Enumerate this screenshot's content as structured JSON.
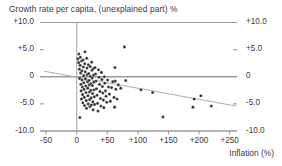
{
  "chart_data": {
    "type": "scatter",
    "title": "Growth rate per capita, (unexplained part) %",
    "xlabel": "Inflation (%)",
    "ylabel": "",
    "xlim": [
      -60,
      262
    ],
    "ylim": [
      -10,
      10
    ],
    "grid": false,
    "legend": null,
    "x_ticks": [
      -50,
      0,
      50,
      100,
      150,
      200,
      250
    ],
    "x_tick_labels": [
      "-50",
      "0",
      "+50",
      "+100",
      "+150",
      "+200",
      "+250"
    ],
    "y_ticks": [
      10,
      5,
      0,
      -5,
      -10
    ],
    "y_tick_labels_left": [
      "+10.0",
      "+5.0",
      "0",
      "-5.0",
      "-10.0"
    ],
    "y_tick_labels_right": [
      "+10.0",
      "+5.0",
      "0",
      "-5.0",
      "-10.0"
    ],
    "reference_lines": {
      "vertical_at_x": 0,
      "horizontal_at_y": 0
    },
    "trend_line": {
      "x_start": -53,
      "y_start": 1.0,
      "x_end": 260,
      "y_end": -5.4
    },
    "series": [
      {
        "name": "countries",
        "marker": "filled-circle",
        "color": "#333333",
        "points": [
          [
            2.0,
            3.3
          ],
          [
            3.1,
            2.6
          ],
          [
            3.6,
            4.2
          ],
          [
            4.4,
            1.4
          ],
          [
            4.8,
            -0.3
          ],
          [
            5.2,
            -7.5
          ],
          [
            5.6,
            2.1
          ],
          [
            6.0,
            3.6
          ],
          [
            6.4,
            0.7
          ],
          [
            6.8,
            -1.4
          ],
          [
            7.2,
            -2.6
          ],
          [
            7.6,
            -4.1
          ],
          [
            8.0,
            2.9
          ],
          [
            8.4,
            1.1
          ],
          [
            8.8,
            -0.6
          ],
          [
            9.2,
            -1.9
          ],
          [
            9.6,
            -3.3
          ],
          [
            10.0,
            -4.8
          ],
          [
            10.4,
            3.1
          ],
          [
            10.8,
            1.8
          ],
          [
            11.2,
            0.2
          ],
          [
            11.6,
            -1.1
          ],
          [
            12.0,
            -2.3
          ],
          [
            12.4,
            -3.8
          ],
          [
            12.8,
            -5.3
          ],
          [
            13.2,
            2.4
          ],
          [
            13.6,
            4.6
          ],
          [
            14.0,
            0.9
          ],
          [
            14.4,
            -0.4
          ],
          [
            14.8,
            -1.7
          ],
          [
            15.2,
            -2.9
          ],
          [
            15.6,
            -4.4
          ],
          [
            16.0,
            -5.8
          ],
          [
            16.4,
            3.4
          ],
          [
            16.8,
            1.6
          ],
          [
            17.2,
            0.4
          ],
          [
            17.6,
            -0.9
          ],
          [
            18.0,
            -2.1
          ],
          [
            18.4,
            -3.5
          ],
          [
            18.8,
            -5.0
          ],
          [
            19.2,
            2.2
          ],
          [
            19.6,
            0.6
          ],
          [
            20.0,
            -0.7
          ],
          [
            20.4,
            -1.5
          ],
          [
            20.8,
            -2.8
          ],
          [
            21.2,
            -4.2
          ],
          [
            21.6,
            -5.5
          ],
          [
            22.0,
            1.9
          ],
          [
            22.4,
            0.1
          ],
          [
            22.8,
            -1.3
          ],
          [
            23.2,
            -2.5
          ],
          [
            23.6,
            -3.9
          ],
          [
            24.0,
            -5.2
          ],
          [
            24.4,
            2.7
          ],
          [
            24.8,
            1.2
          ],
          [
            25.2,
            -0.2
          ],
          [
            25.6,
            -1.6
          ],
          [
            26.0,
            -3.1
          ],
          [
            26.4,
            -4.6
          ],
          [
            26.8,
            -6.1
          ],
          [
            27.2,
            1.5
          ],
          [
            27.6,
            0.3
          ],
          [
            28.0,
            -1.0
          ],
          [
            28.4,
            -2.4
          ],
          [
            28.8,
            -3.7
          ],
          [
            29.2,
            -5.1
          ],
          [
            30.0,
            1.7
          ],
          [
            30.8,
            0.5
          ],
          [
            31.6,
            -0.8
          ],
          [
            32.4,
            -2.2
          ],
          [
            33.2,
            -3.4
          ],
          [
            34.0,
            -4.9
          ],
          [
            34.8,
            -6.3
          ],
          [
            35.6,
            1.3
          ],
          [
            36.4,
            -0.1
          ],
          [
            37.2,
            -1.4
          ],
          [
            38.0,
            -2.7
          ],
          [
            38.8,
            -4.0
          ],
          [
            39.6,
            -5.4
          ],
          [
            40.4,
            0.8
          ],
          [
            41.2,
            -0.5
          ],
          [
            42.0,
            -1.8
          ],
          [
            42.8,
            -3.0
          ],
          [
            43.6,
            -4.3
          ],
          [
            44.4,
            -5.7
          ],
          [
            45.2,
            0.0
          ],
          [
            46.0,
            -1.2
          ],
          [
            47.0,
            -2.6
          ],
          [
            48.0,
            -3.6
          ],
          [
            49.0,
            -4.7
          ],
          [
            50.5,
            -0.6
          ],
          [
            52.0,
            -1.9
          ],
          [
            53.5,
            -3.2
          ],
          [
            55.0,
            -4.5
          ],
          [
            57.0,
            -2.0
          ],
          [
            59.0,
            -0.9
          ],
          [
            61.0,
            -3.8
          ],
          [
            62.0,
            -5.6
          ],
          [
            62.5,
            1.7
          ],
          [
            63.0,
            -0.8
          ],
          [
            64.0,
            -2.3
          ],
          [
            66.0,
            -4.1
          ],
          [
            68.0,
            -1.5
          ],
          [
            72.0,
            -2.1
          ],
          [
            78.0,
            5.5
          ],
          [
            80.0,
            -0.7
          ],
          [
            105.0,
            -2.4
          ],
          [
            124.0,
            -2.9
          ],
          [
            141.0,
            -7.4
          ],
          [
            190.0,
            -5.6
          ],
          [
            192.0,
            -4.1
          ],
          [
            203.0,
            -3.5
          ],
          [
            220.0,
            -5.4
          ]
        ]
      }
    ]
  },
  "colors": {
    "axis": "#9a9a9a",
    "marker": "#333333",
    "trend": "#b0b0b0",
    "text": "#3a3a3a",
    "background": "#ffffff"
  }
}
